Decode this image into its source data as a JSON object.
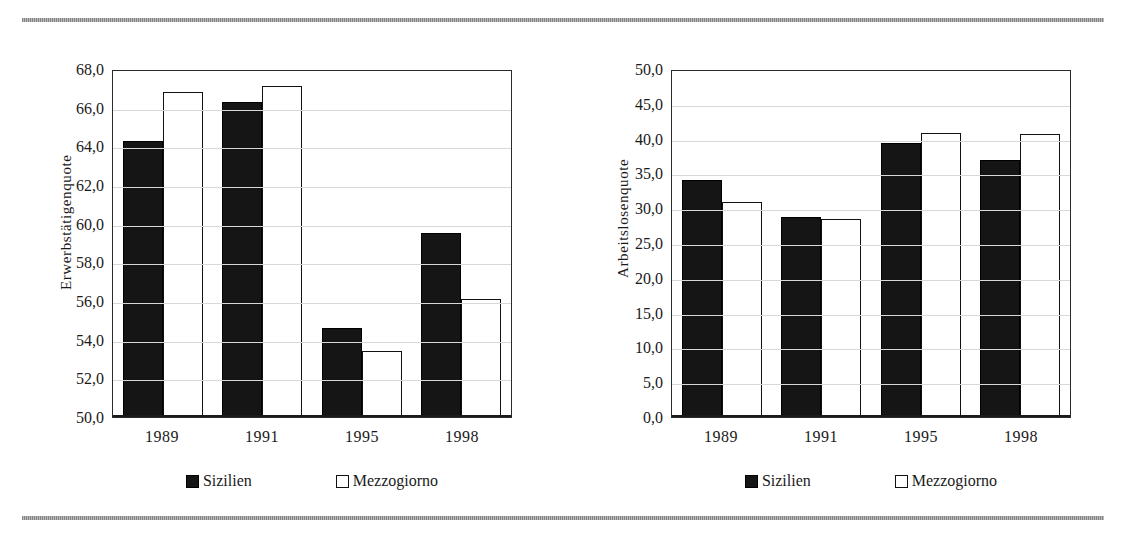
{
  "decor": {
    "top_rule": "horizontal-rule",
    "bottom_rule": "horizontal-rule",
    "rule_color": "#7d7d7d"
  },
  "legend": {
    "series": [
      {
        "label": "Sizilien",
        "swatch": "filled-square",
        "color": "#151515"
      },
      {
        "label": "Mezzogiorno",
        "swatch": "hollow-square",
        "color": "#ffffff"
      }
    ]
  },
  "chart_data": [
    {
      "type": "bar",
      "title": "",
      "xlabel": "",
      "ylabel": "Erwerbstätigenquote",
      "categories": [
        "1989",
        "1991",
        "1995",
        "1998"
      ],
      "ylim": [
        50.0,
        68.0
      ],
      "ytick_step": 2.0,
      "ytick_labels": [
        "68,0",
        "66,0",
        "64,0",
        "62,0",
        "60,0",
        "58,0",
        "56,0",
        "54,0",
        "52,0",
        "50,0"
      ],
      "ytick_values": [
        68.0,
        66.0,
        64.0,
        62.0,
        60.0,
        58.0,
        56.0,
        54.0,
        52.0,
        50.0
      ],
      "grid": true,
      "legend_position": "bottom",
      "series": [
        {
          "name": "Sizilien",
          "values": [
            64.3,
            66.3,
            54.6,
            59.5
          ]
        },
        {
          "name": "Mezzogiorno",
          "values": [
            66.8,
            67.1,
            53.4,
            56.1
          ]
        }
      ]
    },
    {
      "type": "bar",
      "title": "",
      "xlabel": "",
      "ylabel": "Arbeitslosenquote",
      "categories": [
        "1989",
        "1991",
        "1995",
        "1998"
      ],
      "ylim": [
        0.0,
        50.0
      ],
      "ytick_step": 5.0,
      "ytick_labels": [
        "50,0",
        "45,0",
        "40,0",
        "35,0",
        "30,0",
        "25,0",
        "20,0",
        "15,0",
        "10,0",
        "5,0",
        "0,0"
      ],
      "ytick_values": [
        50.0,
        45.0,
        40.0,
        35.0,
        30.0,
        25.0,
        20.0,
        15.0,
        10.0,
        5.0,
        0.0
      ],
      "grid": true,
      "legend_position": "bottom",
      "series": [
        {
          "name": "Sizilien",
          "values": [
            34.0,
            28.8,
            39.4,
            36.9
          ]
        },
        {
          "name": "Mezzogiorno",
          "values": [
            30.9,
            28.5,
            40.8,
            40.6
          ]
        }
      ]
    }
  ]
}
